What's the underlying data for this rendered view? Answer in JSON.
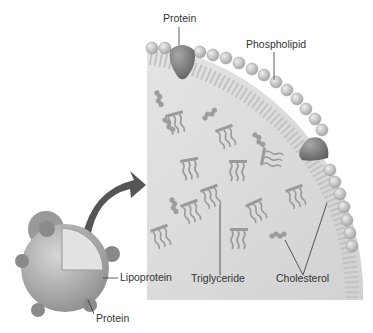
{
  "diagram": {
    "labels": {
      "protein_top": "Protein",
      "phospholipid": "Phospholipid",
      "lipoprotein": "Lipoprotein",
      "protein_bottom": "Protein",
      "triglyceride": "Triglyceride",
      "cholesterol": "Cholesterol"
    },
    "colors": {
      "interior": "#dcdcdc",
      "sphere": "#a9a9a9",
      "protein": "#7c7c7c",
      "head": "#bdbdbd",
      "tail": "#9a9a9a",
      "arrow": "#555555"
    }
  }
}
